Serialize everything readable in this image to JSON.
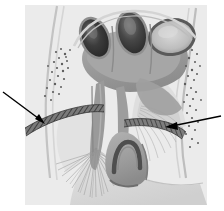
{
  "figure": {
    "domain_kind": "anatomical-illustration",
    "title_visible": false,
    "caption_visible": false,
    "medium": "grayscale halftone line drawing",
    "background_color": "#ffffff",
    "panel": {
      "name": "illustration-panel",
      "x": 25,
      "y": 5,
      "width": 182,
      "height": 200,
      "fill_color": "#ebebeb",
      "border": "none"
    },
    "annotations": {
      "arrows": [
        {
          "name": "left-pointer-arrow",
          "label_text": "",
          "direction": "down-right",
          "tail_x": 3,
          "tail_y": 92,
          "head_x": 44,
          "head_y": 123,
          "color": "#000000",
          "target": "left-hatched-band"
        },
        {
          "name": "right-pointer-arrow",
          "label_text": "",
          "direction": "left",
          "tail_x": 221,
          "tail_y": 116,
          "head_x": 166,
          "head_y": 127,
          "color": "#000000",
          "target": "right-hatched-band"
        }
      ]
    },
    "structures": [
      {
        "name": "dark-oval-left",
        "description": "dark elongated oval chamber, upper left of cluster",
        "cx": 95,
        "cy": 38,
        "rx": 13,
        "ry": 20,
        "rotation": -22,
        "fill_color": "#3b3b3b",
        "rim_color": "#8e8e8e"
      },
      {
        "name": "dark-oval-middle",
        "description": "dark elongated oval chamber, upper middle of cluster",
        "cx": 132,
        "cy": 33,
        "rx": 14,
        "ry": 21,
        "rotation": -14,
        "fill_color": "#474747",
        "rim_color": "#909090"
      },
      {
        "name": "light-oval-right",
        "description": "large pale oval chamber with dark rim, upper right",
        "cx": 172,
        "cy": 37,
        "rx": 22,
        "ry": 17,
        "rotation": -8,
        "fill_color": "#c6c6c6",
        "rim_color": "#5a5a5a"
      },
      {
        "name": "central-body-mass",
        "description": "large mid-gray central trunk / body mass",
        "fill_color": "#9e9e9e"
      },
      {
        "name": "descending-stalk",
        "description": "narrow gray stalk descending from central body to fan",
        "fill_color": "#9a9a9a"
      },
      {
        "name": "left-hatched-band",
        "description": "cross-hatched dark diagonal band, left side",
        "fill_color": "#6e6e6e",
        "hatch_color": "#3a3a3a"
      },
      {
        "name": "right-hatched-band",
        "description": "cross-hatched dark diagonal band, right side",
        "fill_color": "#6e6e6e",
        "hatch_color": "#3a3a3a"
      },
      {
        "name": "bell-dome-structure",
        "description": "bell/dome shaped structure with dark inner arch, lower center",
        "fill_color": "#a3a3a3",
        "arch_color": "#4e4e4e"
      },
      {
        "name": "radiating-fan-left",
        "description": "fan of fine radiating fibres below the descending stalk",
        "line_color": "#8a8a8a"
      },
      {
        "name": "radiating-fan-right",
        "description": "fan of fine radiating fibres to the right of the bell dome",
        "line_color": "#9a9a9a"
      },
      {
        "name": "stipple-field-left",
        "description": "field of small stippled dots along left margin",
        "dot_color": "#5d5d5d"
      },
      {
        "name": "stipple-field-right",
        "description": "field of small stippled dots along right margin",
        "dot_color": "#5d5d5d"
      },
      {
        "name": "outer-membrane-left",
        "description": "pale outer membrane contour running down the left margin",
        "line_color": "#b4b4b4"
      },
      {
        "name": "outer-membrane-right",
        "description": "pale outer membrane contour running down the right margin",
        "line_color": "#b4b4b4"
      },
      {
        "name": "lower-basal-sheet",
        "description": "pale basal sheet sweeping across the lower right of the panel",
        "fill_color": "#dcdcdc"
      }
    ]
  }
}
